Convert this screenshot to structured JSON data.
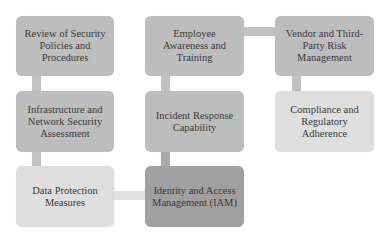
{
  "diagram": {
    "title": "",
    "nodes": [
      {
        "id": "review",
        "label": "Review of Security Policies and Procedures",
        "shade": "mid"
      },
      {
        "id": "infra",
        "label": "Infrastructure and Network Security Assessment",
        "shade": "mid"
      },
      {
        "id": "data",
        "label": "Data Protection Measures",
        "shade": "light"
      },
      {
        "id": "iam",
        "label": "Identity and Access Management (IAM)",
        "shade": "dark"
      },
      {
        "id": "incident",
        "label": "Incident Response Capability",
        "shade": "mid"
      },
      {
        "id": "employee",
        "label": "Employee Awareness and Training",
        "shade": "mid"
      },
      {
        "id": "vendor",
        "label": "Vendor and Third-Party Risk Management",
        "shade": "mid"
      },
      {
        "id": "compliance",
        "label": "Compliance and Regulatory Adherence",
        "shade": "light"
      }
    ],
    "edges": [
      [
        "review",
        "infra"
      ],
      [
        "infra",
        "data"
      ],
      [
        "data",
        "iam"
      ],
      [
        "iam",
        "incident"
      ],
      [
        "incident",
        "employee"
      ],
      [
        "employee",
        "vendor"
      ],
      [
        "vendor",
        "compliance"
      ]
    ],
    "colors": {
      "mid": "#bdbdbd",
      "light": "#dedede",
      "dark": "#a0a0a0",
      "background": "#ffffff"
    }
  }
}
